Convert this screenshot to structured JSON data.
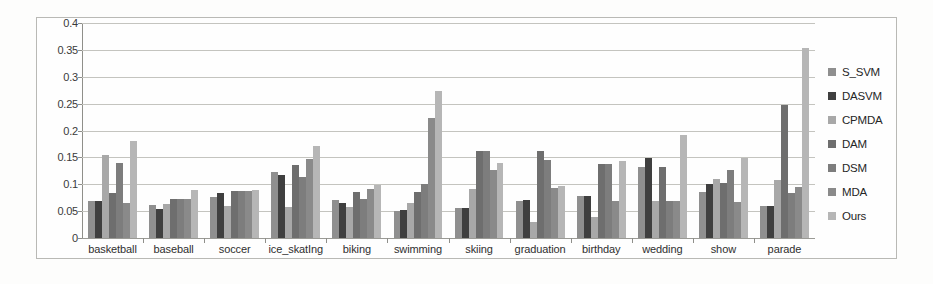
{
  "chart_data": {
    "type": "bar",
    "title": "",
    "subtitle": "",
    "xlabel": "",
    "ylabel": "",
    "ylim": [
      0,
      0.4
    ],
    "ytick_labels": [
      "0",
      "0.05",
      "0.1",
      "0.15",
      "0.2",
      "0.25",
      "0.3",
      "0.35",
      "0.4"
    ],
    "ytick_values": [
      0,
      0.05,
      0.1,
      0.15,
      0.2,
      0.25,
      0.3,
      0.35,
      0.4
    ],
    "grid": true,
    "legend_position": "right",
    "categories": [
      "basketball",
      "baseball",
      "soccer",
      "ice_skatIng",
      "biking",
      "swimming",
      "skiing",
      "graduation",
      "birthday",
      "wedding",
      "show",
      "parade"
    ],
    "series": [
      {
        "name": "S_SVM",
        "color": "#8f8f8f",
        "values": [
          0.068,
          0.062,
          0.077,
          0.122,
          0.07,
          0.051,
          0.055,
          0.068,
          0.078,
          0.133,
          0.086,
          0.06
        ]
      },
      {
        "name": "DASVM",
        "color": "#3f3f3f",
        "values": [
          0.068,
          0.054,
          0.083,
          0.118,
          0.066,
          0.052,
          0.056,
          0.07,
          0.078,
          0.148,
          0.1,
          0.06
        ]
      },
      {
        "name": "CPMDA",
        "color": "#a8a8a8",
        "values": [
          0.155,
          0.063,
          0.06,
          0.058,
          0.057,
          0.066,
          0.092,
          0.03,
          0.04,
          0.068,
          0.11,
          0.108
        ]
      },
      {
        "name": "DAM",
        "color": "#6e6e6e",
        "values": [
          0.083,
          0.073,
          0.088,
          0.136,
          0.085,
          0.086,
          0.161,
          0.161,
          0.138,
          0.133,
          0.103,
          0.248
        ]
      },
      {
        "name": "DSM",
        "color": "#7d7d7d",
        "values": [
          0.139,
          0.072,
          0.088,
          0.114,
          0.073,
          0.1,
          0.161,
          0.145,
          0.138,
          0.068,
          0.126,
          0.083
        ]
      },
      {
        "name": "MDA",
        "color": "#8a8a8a",
        "values": [
          0.065,
          0.072,
          0.088,
          0.147,
          0.092,
          0.224,
          0.126,
          0.093,
          0.068,
          0.068,
          0.067,
          0.095
        ]
      },
      {
        "name": "Ours",
        "color": "#b6b6b6",
        "values": [
          0.181,
          0.09,
          0.09,
          0.172,
          0.098,
          0.273,
          0.139,
          0.096,
          0.144,
          0.192,
          0.148,
          0.353
        ]
      }
    ]
  }
}
